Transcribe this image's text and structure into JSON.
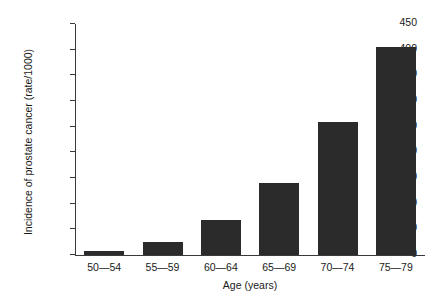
{
  "chart_data": {
    "type": "bar",
    "title": "",
    "xlabel": "Age (years)",
    "ylabel": "Incidence of prostate cancer (rate/1000)",
    "categories": [
      "50—54",
      "55—59",
      "60—64",
      "65—69",
      "70—74",
      "75—79"
    ],
    "values": [
      8,
      25,
      68,
      140,
      260,
      405
    ],
    "ylim": [
      0,
      450
    ],
    "yticks": [
      0,
      50,
      100,
      150,
      200,
      250,
      300,
      350,
      400,
      450
    ],
    "ytick_labels": [
      "0",
      "50",
      "100",
      "150",
      "200",
      "250",
      "300",
      "350",
      "400",
      "450"
    ],
    "grid": false,
    "legend": null,
    "bar_color": "#2b2b2b",
    "axis_color": "#3a3a3a",
    "background": "#ffffff"
  }
}
